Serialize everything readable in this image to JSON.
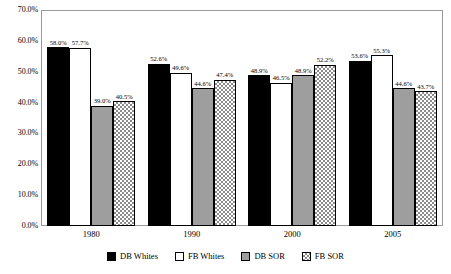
{
  "chart_data": {
    "type": "bar",
    "title": "",
    "subtitle": "",
    "xlabel": "",
    "ylabel": "",
    "categories": [
      "1980",
      "1990",
      "2000",
      "2005"
    ],
    "ylim": [
      0,
      70
    ],
    "ytick_labels": [
      "0.0%",
      "10.0%",
      "20.0%",
      "30.0%",
      "40.0%",
      "50.0%",
      "60.0%",
      "70.0%"
    ],
    "ytick_values": [
      0,
      10,
      20,
      30,
      40,
      50,
      60,
      70
    ],
    "grid": false,
    "legend_position": "bottom",
    "series": [
      {
        "name": "DB Whites",
        "swatch": "s-db-whites",
        "color": "#000000",
        "values": [
          58.0,
          52.6,
          48.9,
          53.6
        ],
        "labels": [
          "58.0%",
          "52.6%",
          "48.9%",
          "53.6%"
        ]
      },
      {
        "name": "FB Whites",
        "swatch": "s-fb-whites",
        "color": "#ffffff",
        "values": [
          57.7,
          49.6,
          46.5,
          55.3
        ],
        "labels": [
          "57.7%",
          "49.6%",
          "46.5%",
          "55.3%"
        ]
      },
      {
        "name": "DB SOR",
        "swatch": "s-db-sor",
        "color": "#9e9e9e",
        "values": [
          39.0,
          44.6,
          48.9,
          44.6
        ],
        "labels": [
          "39.0%",
          "44.6%",
          "48.9%",
          "44.6%"
        ]
      },
      {
        "name": "FB SOR",
        "swatch": "s-fb-sor",
        "color": "checkered",
        "values": [
          40.5,
          47.4,
          52.2,
          43.7
        ],
        "labels": [
          "40.5%",
          "47.4%",
          "52.2%",
          "43.7%"
        ]
      }
    ]
  }
}
